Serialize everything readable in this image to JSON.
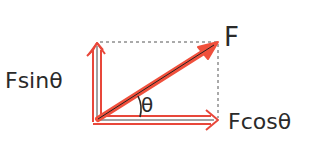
{
  "diagram": {
    "type": "force-vector-decomposition",
    "labels": {
      "force": "F",
      "vertical_component": "Fsinθ",
      "horizontal_component": "Fcosθ",
      "angle": "θ"
    },
    "colors": {
      "vector_fill": "#f0503c",
      "vector_outline": "#e8473a",
      "inner_line": "#333333",
      "dashed_guide": "#555555",
      "text": "#2a2a2a"
    }
  }
}
